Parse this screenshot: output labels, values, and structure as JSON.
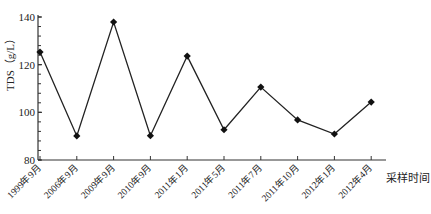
{
  "chart_data": {
    "type": "line",
    "title": "",
    "xlabel": "采样时间",
    "ylabel": "TDS（g/L）",
    "ylim": [
      80,
      140
    ],
    "yticks": [
      80,
      100,
      120,
      140
    ],
    "grid": false,
    "legend": null,
    "categories": [
      "1999年9月",
      "2006年9月",
      "2009年9月",
      "2010年9月",
      "2011年1月",
      "2011年5月",
      "2011年7月",
      "2011年10月",
      "2012年1月",
      "2012年4月"
    ],
    "series": [
      {
        "name": "TDS",
        "marker": "diamond",
        "color": "#222222",
        "values": [
          125.3,
          90.1,
          137.9,
          90.2,
          123.6,
          92.7,
          110.6,
          96.8,
          90.9,
          104.3
        ]
      }
    ]
  }
}
